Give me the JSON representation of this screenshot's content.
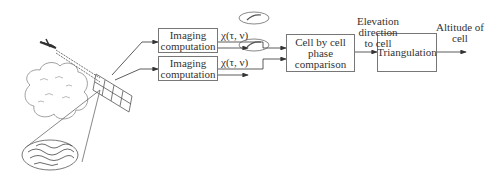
{
  "diagram": {
    "boxes": {
      "imaging_top": "Imaging computation",
      "imaging_bottom": "Imaging computation",
      "phase_comparison": "Cell by cell phase comparison",
      "triangulation": "Triangulation"
    },
    "labels": {
      "chi_top": "χ(τ, ν)",
      "chi_bottom": "χ(τ, ν)",
      "elevation": "Elevation direction to cell",
      "altitude": "Altitude of cell"
    }
  }
}
